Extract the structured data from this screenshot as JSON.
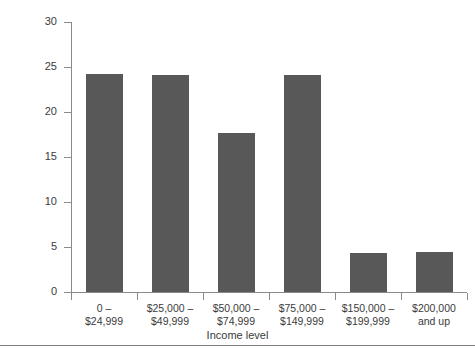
{
  "chart_data": {
    "type": "bar",
    "title": "",
    "xlabel": "Income level",
    "ylabel": "Percent of the population",
    "categories": [
      "0 –\n$24,999",
      "$25,000 –\n$49,999",
      "$50,000 –\n$74,999",
      "$75,000 –\n$149,999",
      "$150,000 –\n$199,999",
      "$200,000\nand up"
    ],
    "category_lines": [
      [
        "0 –",
        "$24,999"
      ],
      [
        "$25,000 –",
        "$49,999"
      ],
      [
        "$50,000 –",
        "$74,999"
      ],
      [
        "$75,000 –",
        "$149,999"
      ],
      [
        "$150,000 –",
        "$199,999"
      ],
      [
        "$200,000",
        "and up"
      ]
    ],
    "values": [
      24.2,
      24.1,
      17.7,
      24.1,
      4.3,
      4.4
    ],
    "ylim": [
      0,
      30
    ],
    "yticks": [
      0,
      5,
      10,
      15,
      20,
      25,
      30
    ],
    "ytick_labels": [
      "0",
      "5",
      "10",
      "15",
      "20",
      "25",
      "30"
    ],
    "grid": false,
    "legend": null,
    "bar_color": "#585858",
    "axis_color": "#8a8a8a",
    "text_color": "#3b3b3b",
    "background": "#ffffff"
  }
}
